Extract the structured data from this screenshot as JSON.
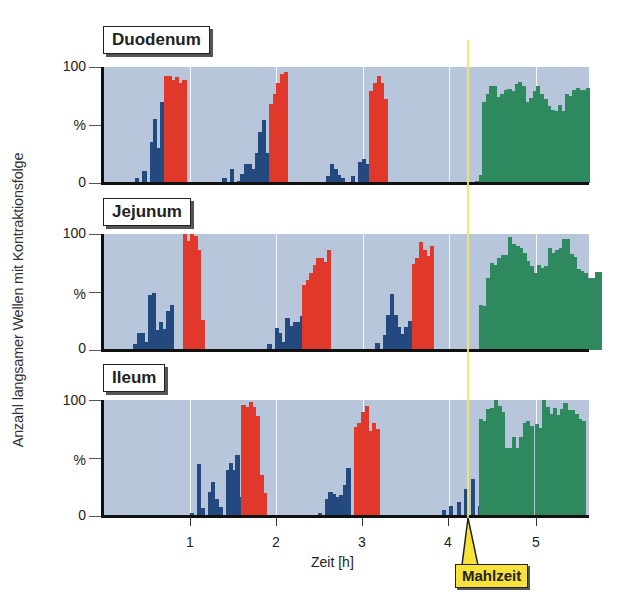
{
  "chart_data": {
    "type": "bar",
    "subtype": "histogram-small-multiples",
    "ylabel": "Anzahl langsamer Wellen mit Kontraktionsfolge",
    "xlabel": "Zeit [h]",
    "x_ticks": [
      1,
      2,
      3,
      4,
      5
    ],
    "xlim": [
      0,
      5.62
    ],
    "y_ticks": [
      "0",
      "%",
      "100"
    ],
    "ylim": [
      0,
      100
    ],
    "bin_width_h": 0.0417,
    "annotation": {
      "label": "Mahlzeit",
      "x": 4.2,
      "color": "#f7e23a"
    },
    "legend_colors": {
      "phase_II_irregular": "#23497e",
      "phase_III_MMC": "#e0382a",
      "postprandial": "#2e8a5e"
    },
    "panels": [
      {
        "title": "Duodenum",
        "segments": [
          {
            "start": 0.33,
            "color": "#23497e",
            "values": [
              0,
              4,
              0,
              10,
              0,
              35,
              55,
              30,
              70
            ]
          },
          {
            "start": 0.71,
            "color": "#e0382a",
            "values": [
              92,
              92,
              89,
              91,
              86,
              89
            ]
          },
          {
            "start": 1.38,
            "color": "#23497e",
            "values": [
              4,
              0,
              12,
              0,
              2,
              8,
              16,
              16,
              12,
              26,
              44,
              54,
              26
            ]
          },
          {
            "start": 1.92,
            "color": "#e0382a",
            "values": [
              68,
              77,
              86,
              94,
              96
            ]
          },
          {
            "start": 2.58,
            "color": "#23497e",
            "values": [
              6,
              16,
              12,
              7,
              4
            ]
          },
          {
            "start": 2.87,
            "color": "#23497e",
            "values": [
              6,
              0,
              18,
              21,
              16,
              11
            ]
          },
          {
            "start": 3.08,
            "color": "#e0382a",
            "values": [
              79,
              86,
              92,
              86,
              72
            ]
          },
          {
            "start": 4.3,
            "color": "#2e8a5e",
            "values": [
              2,
              7,
              70,
              77,
              84,
              84,
              74,
              77,
              80,
              81,
              79,
              85,
              87,
              84,
              70,
              73,
              79,
              84,
              77,
              72,
              66,
              63,
              62,
              67,
              62,
              77,
              75,
              80,
              82
            ]
          },
          {
            "start": 5.42,
            "color": "#2e8a5e",
            "values": [
              74,
              70,
              80,
              80,
              82
            ]
          }
        ]
      },
      {
        "title": "Jejunum",
        "segments": [
          {
            "start": 0.35,
            "color": "#23497e",
            "values": [
              5,
              15,
              15,
              7
            ]
          },
          {
            "start": 0.52,
            "color": "#23497e",
            "values": [
              47,
              49,
              17,
              24,
              18,
              34,
              39
            ]
          },
          {
            "start": 0.92,
            "color": "#e0382a",
            "values": [
              100,
              94,
              100,
              98,
              86,
              26
            ]
          },
          {
            "start": 1.9,
            "color": "#23497e",
            "values": [
              5,
              0,
              19,
              15,
              7,
              28,
              21,
              24,
              24,
              29
            ]
          },
          {
            "start": 2.3,
            "color": "#e0382a",
            "values": [
              56,
              60,
              66,
              73,
              79,
              79,
              76,
              86
            ]
          },
          {
            "start": 3.15,
            "color": "#23497e",
            "values": [
              6,
              0,
              13,
              30,
              48,
              30,
              20,
              14,
              20,
              25
            ]
          },
          {
            "start": 3.57,
            "color": "#e0382a",
            "values": [
              74,
              79,
              93,
              86,
              81,
              90
            ]
          },
          {
            "start": 4.35,
            "color": "#2e8a5e",
            "values": [
              39,
              38,
              62,
              75,
              73,
              79,
              82,
              82,
              97,
              91,
              90,
              88,
              84,
              77,
              72,
              66,
              73,
              71
            ]
          },
          {
            "start": 5.1,
            "color": "#2e8a5e",
            "values": [
              72,
              88,
              84,
              86,
              88,
              96,
              96,
              83,
              80,
              70,
              68,
              66,
              62,
              62,
              67,
              67
            ]
          }
        ]
      },
      {
        "title": "Ileum",
        "segments": [
          {
            "start": 1.0,
            "color": "#23497e",
            "values": [
              3,
              0,
              45,
              7,
              0,
              21,
              29,
              15,
              8,
              0,
              40,
              46,
              40,
              16
            ]
          },
          {
            "start": 1.53,
            "color": "#23497e",
            "values": [
              53
            ]
          },
          {
            "start": 1.6,
            "color": "#e0382a",
            "values": [
              96,
              94,
              98,
              94,
              86,
              35,
              20
            ]
          },
          {
            "start": 2.48,
            "color": "#23497e",
            "values": [
              3,
              0,
              15,
              21,
              19,
              16,
              18,
              27,
              41
            ]
          },
          {
            "start": 2.9,
            "color": "#e0382a",
            "values": [
              77,
              80,
              90,
              95,
              73,
              80,
              75
            ]
          },
          {
            "start": 3.92,
            "color": "#23497e",
            "values": [
              5,
              0,
              9,
              0,
              12,
              0,
              23,
              0,
              32,
              0,
              9
            ]
          },
          {
            "start": 4.35,
            "color": "#2e8a5e",
            "values": [
              84,
              82,
              92,
              93,
              100,
              95,
              90,
              59,
              59,
              68,
              59,
              68,
              80,
              82,
              78
            ]
          },
          {
            "start": 4.99,
            "color": "#2e8a5e",
            "values": [
              79,
              76,
              100,
              94,
              88,
              93,
              87,
              92,
              97,
              91,
              91,
              88,
              84,
              82
            ]
          }
        ]
      }
    ]
  },
  "labels": {
    "y_axis_title": "Anzahl langsamer Wellen mit Kontraktionsfolge",
    "x_axis_title": "Zeit [h]",
    "y_top": "100",
    "y_mid": "%",
    "y_bottom": "0",
    "x_ticks": [
      "1",
      "2",
      "3",
      "4",
      "5"
    ],
    "meal": "Mahlzeit",
    "panel_titles": [
      "Duodenum",
      "Jejunum",
      "Ileum"
    ]
  }
}
